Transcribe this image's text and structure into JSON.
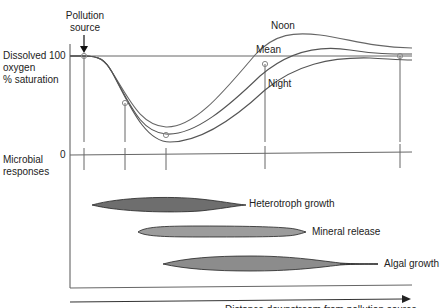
{
  "pollution_label": [
    "Pollution",
    "source"
  ],
  "y_axis_upper": {
    "label": [
      "Dissolved",
      "oxygen",
      "% saturation"
    ],
    "tick_100": "100"
  },
  "y_axis_lower": {
    "label": [
      "Microbial",
      "responses"
    ],
    "tick_0": "0"
  },
  "curves": [
    {
      "name": "Noon",
      "label": "Noon"
    },
    {
      "name": "Mean",
      "label": "Mean"
    },
    {
      "name": "Night",
      "label": "Night"
    }
  ],
  "responses": [
    {
      "name": "heterotroph",
      "label": "Heterotroph growth",
      "color": "#6e6e6e"
    },
    {
      "name": "mineral",
      "label": "Mineral release",
      "color": "#9a9a9a"
    },
    {
      "name": "algal",
      "label": "Algal growth",
      "color": "#8a8a8a"
    }
  ],
  "colors": {
    "line": "#555555",
    "axis": "#444444",
    "fill_dark": "#6e6e6e",
    "fill_light": "#9a9a9a"
  },
  "x_arrow_caption": "Distance downstream from pollution source"
}
